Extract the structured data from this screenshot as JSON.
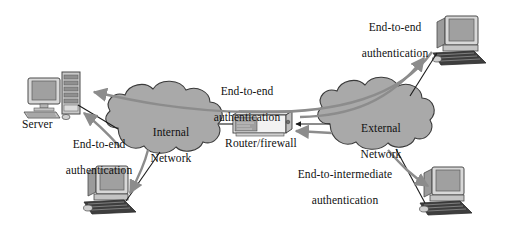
{
  "figure": {
    "type": "network-security-diagram",
    "background_color": "#ffffff",
    "palette": {
      "cloud_fill": "#a9a9a9",
      "cloud_stroke": "#3a3a3a",
      "device_light": "#d8d8d8",
      "device_mid": "#b4b4b4",
      "device_dark": "#6e6e6e",
      "screen_fill": "#a0a0a0",
      "line_black": "#1a1a1a",
      "arrow_gray": "#8c8c8c",
      "text_color": "#111111"
    }
  },
  "clouds": [
    {
      "id": "internal-network",
      "line1": "Internal",
      "line2": "Network",
      "cx": 170,
      "cy": 128
    },
    {
      "id": "external-network",
      "line1": "External",
      "line2": "Network",
      "cx": 380,
      "cy": 124
    }
  ],
  "devices": [
    {
      "id": "server",
      "kind": "desktop-and-tower",
      "label": "Server",
      "label_x": 22,
      "label_y": 118
    },
    {
      "id": "internal-workstation",
      "kind": "desktop",
      "label": "",
      "label_x": 0,
      "label_y": 0
    },
    {
      "id": "external-workstation-top",
      "kind": "desktop",
      "label": "",
      "label_x": 0,
      "label_y": 0
    },
    {
      "id": "external-workstation-bottom",
      "kind": "desktop",
      "label": "",
      "label_x": 0,
      "label_y": 0
    },
    {
      "id": "router-firewall",
      "kind": "rack-device",
      "label": "Router/firewall",
      "label_x": 228,
      "label_y": 137
    }
  ],
  "annotations": [
    {
      "id": "annotation-server-end-to-end",
      "line1": "End-to-end",
      "line2": "authentication",
      "x": 49,
      "y": 125,
      "width": 100
    },
    {
      "id": "annotation-center-end-to-end",
      "line1": "End-to-end",
      "line2": "authentication",
      "x": 192,
      "y": 72,
      "width": 110
    },
    {
      "id": "annotation-top-right-end-to-end",
      "line1": "End-to-end",
      "line2": "authentication",
      "x": 340,
      "y": 8,
      "width": 110
    },
    {
      "id": "annotation-end-to-intermediate",
      "line1": "End-to-intermediate",
      "line2": "authentication",
      "x": 281,
      "y": 155,
      "width": 120
    }
  ],
  "connections": [
    {
      "id": "link-server-to-internal-cloud",
      "style": "solid-black",
      "from": "server",
      "to": "internal-network"
    },
    {
      "id": "link-internal-cloud-to-workstation",
      "style": "solid-black",
      "from": "internal-network",
      "to": "internal-workstation"
    },
    {
      "id": "link-internal-cloud-to-router",
      "style": "solid-black",
      "from": "internal-network",
      "to": "router-firewall"
    },
    {
      "id": "link-router-to-external-cloud",
      "style": "solid-black-arrow",
      "from": "external-network",
      "to": "router-firewall"
    },
    {
      "id": "link-external-cloud-to-top-workstation",
      "style": "solid-black",
      "from": "external-network",
      "to": "external-workstation-top"
    },
    {
      "id": "link-external-cloud-to-bottom-workstation",
      "style": "solid-black",
      "from": "external-network",
      "to": "external-workstation-bottom"
    }
  ],
  "flows": [
    {
      "id": "flow-end-to-end-external-top-to-server",
      "style": "gray-arrow",
      "description": "End-to-end authentication from top external workstation through both networks to the server",
      "direction": "right-to-left"
    },
    {
      "id": "flow-end-to-end-server-to-external-top",
      "style": "gray-arrow",
      "description": "End-to-end authentication from server out to the top external workstation",
      "direction": "left-to-right"
    },
    {
      "id": "flow-end-to-end-internal-workstation-to-server",
      "style": "gray-arrow",
      "description": "End-to-end authentication from internal workstation to the server",
      "direction": "up-left"
    },
    {
      "id": "flow-internal-cloud-to-internal-workstation",
      "style": "gray-arrow",
      "description": "Authentication flow down from internal network to internal workstation",
      "direction": "downward"
    },
    {
      "id": "flow-end-to-intermediate-to-router",
      "style": "gray-arrow",
      "description": "End-to-intermediate authentication arriving at the router/firewall",
      "direction": "right-to-left"
    },
    {
      "id": "flow-end-to-intermediate-to-bottom-workstation",
      "style": "gray-arrow",
      "description": "End-to-intermediate authentication from external network to bottom external workstation",
      "direction": "down-right"
    }
  ]
}
